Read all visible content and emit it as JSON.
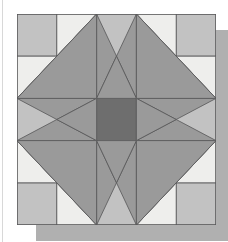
{
  "page": {
    "background_color": "#ffffff",
    "width": 228,
    "height": 242,
    "margin_rule_color": "#d8d8d8"
  },
  "block": {
    "name": "Sawtooth Star Quilt Block",
    "pattern_type": "pieced-patchwork",
    "grid_rows": 5,
    "grid_cols": 5,
    "origin_x": 17,
    "origin_y": 14,
    "width": 199,
    "height": 211,
    "cell_width": 39.8,
    "cell_height": 42.2,
    "outline_color": "#58585a",
    "outline_width": 0.8,
    "shadow_color": "#b0b0b0"
  },
  "palette": {
    "background_gray": "#c2c2c2",
    "cream": "#eeeeec",
    "mid_gray": "#9a9a9a",
    "dark_gray": "#6e6e6e",
    "outline": "#58585a",
    "page_white": "#ffffff"
  },
  "legend": {
    "fabrics": [
      {
        "key": "background_gray",
        "label": "Background Gray",
        "color": "#c2c2c2"
      },
      {
        "key": "cream",
        "label": "Cream",
        "color": "#eeeeec"
      },
      {
        "key": "mid_gray",
        "label": "Medium Gray",
        "color": "#9a9a9a"
      },
      {
        "key": "dark_gray",
        "label": "Dark Gray",
        "color": "#6e6e6e"
      }
    ]
  },
  "chart_data": {
    "type": "diagram",
    "units_x": 5,
    "units_y": 5,
    "note": "Coordinates are in grid units (0-5), origin top-left. Each patch lists fill key from palette.",
    "patches": [
      {
        "id": "corner-tl",
        "shape": "rect",
        "fill": "background_gray",
        "points": [
          [
            0,
            0
          ],
          [
            1,
            0
          ],
          [
            1,
            1
          ],
          [
            0,
            1
          ]
        ]
      },
      {
        "id": "corner-tr",
        "shape": "rect",
        "fill": "background_gray",
        "points": [
          [
            4,
            0
          ],
          [
            5,
            0
          ],
          [
            5,
            1
          ],
          [
            4,
            1
          ]
        ]
      },
      {
        "id": "corner-bl",
        "shape": "rect",
        "fill": "background_gray",
        "points": [
          [
            0,
            4
          ],
          [
            1,
            4
          ],
          [
            1,
            5
          ],
          [
            0,
            5
          ]
        ]
      },
      {
        "id": "corner-br",
        "shape": "rect",
        "fill": "background_gray",
        "points": [
          [
            4,
            4
          ],
          [
            5,
            4
          ],
          [
            5,
            5
          ],
          [
            4,
            5
          ]
        ]
      },
      {
        "id": "top-geese-left-cream",
        "shape": "triangle",
        "fill": "cream",
        "points": [
          [
            1,
            0
          ],
          [
            2,
            0
          ],
          [
            1,
            1
          ]
        ]
      },
      {
        "id": "top-geese-left-bg",
        "shape": "triangle",
        "fill": "background_gray",
        "points": [
          [
            2,
            0
          ],
          [
            2,
            1
          ],
          [
            1,
            1
          ]
        ]
      },
      {
        "id": "top-geese-right-cream",
        "shape": "triangle",
        "fill": "cream",
        "points": [
          [
            3,
            0
          ],
          [
            4,
            0
          ],
          [
            4,
            1
          ]
        ]
      },
      {
        "id": "top-geese-right-bg",
        "shape": "triangle",
        "fill": "background_gray",
        "points": [
          [
            3,
            0
          ],
          [
            4,
            1
          ],
          [
            3,
            1
          ]
        ]
      },
      {
        "id": "top-center-bg",
        "shape": "rect",
        "fill": "background_gray",
        "points": [
          [
            2,
            0
          ],
          [
            3,
            0
          ],
          [
            3,
            1
          ],
          [
            2,
            1
          ]
        ]
      },
      {
        "id": "bottom-geese-left-cream",
        "shape": "triangle",
        "fill": "cream",
        "points": [
          [
            1,
            4
          ],
          [
            2,
            5
          ],
          [
            1,
            5
          ]
        ]
      },
      {
        "id": "bottom-geese-left-bg",
        "shape": "triangle",
        "fill": "background_gray",
        "points": [
          [
            1,
            4
          ],
          [
            2,
            4
          ],
          [
            2,
            5
          ]
        ]
      },
      {
        "id": "bottom-geese-right-cream",
        "shape": "triangle",
        "fill": "cream",
        "points": [
          [
            4,
            4
          ],
          [
            4,
            5
          ],
          [
            3,
            5
          ]
        ]
      },
      {
        "id": "bottom-geese-right-bg",
        "shape": "triangle",
        "fill": "background_gray",
        "points": [
          [
            3,
            4
          ],
          [
            4,
            4
          ],
          [
            3,
            5
          ]
        ]
      },
      {
        "id": "bottom-center-bg",
        "shape": "rect",
        "fill": "background_gray",
        "points": [
          [
            2,
            4
          ],
          [
            3,
            4
          ],
          [
            3,
            5
          ],
          [
            2,
            5
          ]
        ]
      },
      {
        "id": "left-geese-top-cream",
        "shape": "triangle",
        "fill": "cream",
        "points": [
          [
            0,
            1
          ],
          [
            1,
            1
          ],
          [
            0,
            2
          ]
        ]
      },
      {
        "id": "left-geese-top-bg",
        "shape": "triangle",
        "fill": "background_gray",
        "points": [
          [
            1,
            1
          ],
          [
            1,
            2
          ],
          [
            0,
            2
          ]
        ]
      },
      {
        "id": "left-geese-bot-cream",
        "shape": "triangle",
        "fill": "cream",
        "points": [
          [
            0,
            3
          ],
          [
            1,
            4
          ],
          [
            0,
            4
          ]
        ]
      },
      {
        "id": "left-geese-bot-bg",
        "shape": "triangle",
        "fill": "background_gray",
        "points": [
          [
            0,
            3
          ],
          [
            1,
            3
          ],
          [
            1,
            4
          ]
        ]
      },
      {
        "id": "left-center-bg",
        "shape": "rect",
        "fill": "background_gray",
        "points": [
          [
            0,
            2
          ],
          [
            1,
            2
          ],
          [
            1,
            3
          ],
          [
            0,
            3
          ]
        ]
      },
      {
        "id": "right-geese-top-cream",
        "shape": "triangle",
        "fill": "cream",
        "points": [
          [
            4,
            1
          ],
          [
            5,
            1
          ],
          [
            5,
            2
          ]
        ]
      },
      {
        "id": "right-geese-top-bg",
        "shape": "triangle",
        "fill": "background_gray",
        "points": [
          [
            4,
            1
          ],
          [
            5,
            2
          ],
          [
            4,
            2
          ]
        ]
      },
      {
        "id": "right-geese-bot-cream",
        "shape": "triangle",
        "fill": "cream",
        "points": [
          [
            5,
            3
          ],
          [
            5,
            4
          ],
          [
            4,
            4
          ]
        ]
      },
      {
        "id": "right-geese-bot-bg",
        "shape": "triangle",
        "fill": "background_gray",
        "points": [
          [
            4,
            3
          ],
          [
            5,
            3
          ],
          [
            4,
            4
          ]
        ]
      },
      {
        "id": "right-center-bg",
        "shape": "rect",
        "fill": "background_gray",
        "points": [
          [
            4,
            2
          ],
          [
            5,
            2
          ],
          [
            5,
            3
          ],
          [
            4,
            3
          ]
        ]
      },
      {
        "id": "inner-sq-tl",
        "shape": "rect",
        "fill": "dark_gray",
        "points": [
          [
            1,
            1
          ],
          [
            2,
            1
          ],
          [
            2,
            2
          ],
          [
            1,
            2
          ]
        ]
      },
      {
        "id": "inner-sq-tr",
        "shape": "rect",
        "fill": "dark_gray",
        "points": [
          [
            3,
            1
          ],
          [
            4,
            1
          ],
          [
            4,
            2
          ],
          [
            3,
            2
          ]
        ]
      },
      {
        "id": "inner-sq-bl",
        "shape": "rect",
        "fill": "dark_gray",
        "points": [
          [
            1,
            3
          ],
          [
            2,
            3
          ],
          [
            2,
            4
          ],
          [
            1,
            4
          ]
        ]
      },
      {
        "id": "inner-sq-br",
        "shape": "rect",
        "fill": "dark_gray",
        "points": [
          [
            3,
            3
          ],
          [
            4,
            3
          ],
          [
            4,
            4
          ],
          [
            3,
            4
          ]
        ]
      },
      {
        "id": "center-square",
        "shape": "rect",
        "fill": "dark_gray",
        "points": [
          [
            2,
            2
          ],
          [
            3,
            2
          ],
          [
            3,
            3
          ],
          [
            2,
            3
          ]
        ]
      },
      {
        "id": "star-point-top-left-half",
        "shape": "triangle",
        "fill": "mid_gray",
        "points": [
          [
            2,
            0
          ],
          [
            2.5,
            1
          ],
          [
            2,
            2
          ]
        ]
      },
      {
        "id": "star-point-top-right-half",
        "shape": "triangle",
        "fill": "mid_gray",
        "points": [
          [
            3,
            0
          ],
          [
            3,
            2
          ],
          [
            2.5,
            1
          ]
        ]
      },
      {
        "id": "star-point-top-fill",
        "shape": "triangle",
        "fill": "mid_gray",
        "points": [
          [
            2,
            2
          ],
          [
            2.5,
            1
          ],
          [
            3,
            2
          ]
        ]
      },
      {
        "id": "star-point-bottom-left-half",
        "shape": "triangle",
        "fill": "mid_gray",
        "points": [
          [
            2,
            5
          ],
          [
            2,
            3
          ],
          [
            2.5,
            4
          ]
        ]
      },
      {
        "id": "star-point-bottom-right-half",
        "shape": "triangle",
        "fill": "mid_gray",
        "points": [
          [
            3,
            5
          ],
          [
            2.5,
            4
          ],
          [
            3,
            3
          ]
        ]
      },
      {
        "id": "star-point-bottom-fill",
        "shape": "triangle",
        "fill": "mid_gray",
        "points": [
          [
            2,
            3
          ],
          [
            3,
            3
          ],
          [
            2.5,
            4
          ]
        ]
      },
      {
        "id": "star-point-left-top-half",
        "shape": "triangle",
        "fill": "mid_gray",
        "points": [
          [
            0,
            2
          ],
          [
            1,
            2.5
          ],
          [
            2,
            2
          ]
        ]
      },
      {
        "id": "star-point-left-bottom-half",
        "shape": "triangle",
        "fill": "mid_gray",
        "points": [
          [
            0,
            3
          ],
          [
            2,
            3
          ],
          [
            1,
            2.5
          ]
        ]
      },
      {
        "id": "star-point-left-fill",
        "shape": "triangle",
        "fill": "mid_gray",
        "points": [
          [
            2,
            2
          ],
          [
            2,
            3
          ],
          [
            1,
            2.5
          ]
        ]
      },
      {
        "id": "star-point-right-top-half",
        "shape": "triangle",
        "fill": "mid_gray",
        "points": [
          [
            5,
            2
          ],
          [
            3,
            2
          ],
          [
            4,
            2.5
          ]
        ]
      },
      {
        "id": "star-point-right-bottom-half",
        "shape": "triangle",
        "fill": "mid_gray",
        "points": [
          [
            5,
            3
          ],
          [
            4,
            2.5
          ],
          [
            3,
            3
          ]
        ]
      },
      {
        "id": "star-point-right-fill",
        "shape": "triangle",
        "fill": "mid_gray",
        "points": [
          [
            3,
            2
          ],
          [
            4,
            2.5
          ],
          [
            3,
            3
          ]
        ]
      },
      {
        "id": "diag-tl-upper",
        "shape": "triangle",
        "fill": "mid_gray",
        "points": [
          [
            2,
            0
          ],
          [
            2,
            2
          ],
          [
            0,
            2
          ]
        ]
      },
      {
        "id": "diag-tr-upper",
        "shape": "triangle",
        "fill": "mid_gray",
        "points": [
          [
            3,
            0
          ],
          [
            5,
            2
          ],
          [
            3,
            2
          ]
        ]
      },
      {
        "id": "diag-bl-lower",
        "shape": "triangle",
        "fill": "mid_gray",
        "points": [
          [
            2,
            5
          ],
          [
            0,
            3
          ],
          [
            2,
            3
          ]
        ]
      },
      {
        "id": "diag-br-lower",
        "shape": "triangle",
        "fill": "mid_gray",
        "points": [
          [
            3,
            5
          ],
          [
            3,
            3
          ],
          [
            5,
            3
          ]
        ]
      }
    ]
  }
}
